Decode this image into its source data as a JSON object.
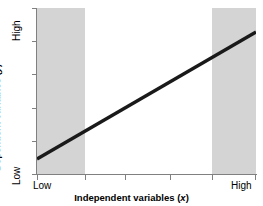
{
  "chart_data": {
    "type": "line",
    "title": "",
    "xlabel": "Independent variables (x)",
    "ylabel": "Dependent variables (y)",
    "xlabel_text": "Independent variables (",
    "xlabel_var": "x",
    "xlabel_close": ")",
    "ylabel_text": "Dependent variables (",
    "ylabel_var": "y",
    "ylabel_close": ")",
    "x_tick_labels": [
      "Low",
      "High"
    ],
    "y_tick_labels": [
      "High",
      "Low"
    ],
    "x_tick_low": "Low",
    "x_tick_high": "High",
    "y_tick_low": "Low",
    "y_tick_high": "High",
    "xlim": [
      "Low",
      "High"
    ],
    "ylim": [
      "Low",
      "High"
    ],
    "grid": false,
    "legend": null,
    "series": [
      {
        "name": "linear trend",
        "x": [
          0.0,
          1.0
        ],
        "y": [
          0.09,
          0.855
        ],
        "color": "#1a1a1a",
        "linewidth": 3
      }
    ],
    "shaded_regions": [
      {
        "name": "left-shaded-band",
        "x_start": 0.0,
        "x_end": 0.22,
        "color": "#d4d4d4"
      },
      {
        "name": "right-shaded-band",
        "x_start": 0.8,
        "x_end": 1.0,
        "color": "#d4d4d4"
      }
    ],
    "x_tick_positions": [
      0.0,
      0.22,
      0.4,
      0.61,
      0.8,
      1.0
    ],
    "y_tick_positions": [
      0.0,
      0.2,
      0.4,
      0.6,
      0.8,
      1.0
    ],
    "axis_color": "#808080",
    "background": "#ffffff"
  }
}
